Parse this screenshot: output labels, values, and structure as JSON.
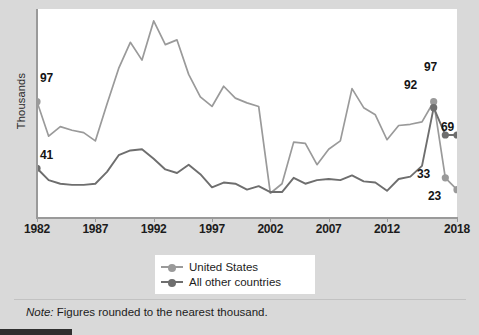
{
  "figure": {
    "ylabel": "Thousands",
    "note_label": "Note:",
    "note_text": " Figures rounded to the nearest thousand.",
    "colors": {
      "series_us": "#9a9a9a",
      "series_other": "#6e6e6e",
      "axis": "#9a9a9a",
      "plot_background": "#ffffff",
      "page_background": "#d9d9d9",
      "text": "#1c1c1c"
    }
  },
  "legend": {
    "position": "below-axis-center",
    "items": [
      {
        "label": "United States",
        "color": "#9a9a9a",
        "marker": "circle"
      },
      {
        "label": "All other countries",
        "color": "#6e6e6e",
        "marker": "circle"
      }
    ]
  },
  "annotations": [
    {
      "id": "us-start",
      "text": "97",
      "x": 40,
      "y": 71,
      "series": "United States",
      "year": 1982,
      "value": 97
    },
    {
      "id": "oth-start",
      "text": "41",
      "x": 40,
      "y": 148,
      "series": "All other countries",
      "year": 1982,
      "value": 41
    },
    {
      "id": "us-peak",
      "text": "97",
      "x": 424,
      "y": 60,
      "series": "United States",
      "year": 2016,
      "value": 97
    },
    {
      "id": "oth-peak",
      "text": "92",
      "x": 404,
      "y": 78,
      "series": "All other countries",
      "year": 2016,
      "value": 92
    },
    {
      "id": "oth-end",
      "text": "69",
      "x": 441,
      "y": 120,
      "series": "All other countries",
      "year": 2018,
      "value": 69
    },
    {
      "id": "us-2017",
      "text": "33",
      "x": 417,
      "y": 167,
      "series": "United States",
      "year": 2017,
      "value": 33
    },
    {
      "id": "us-end",
      "text": "23",
      "x": 428,
      "y": 189,
      "series": "United States",
      "year": 2018,
      "value": 23
    }
  ],
  "chart_data": {
    "type": "line",
    "title": "",
    "xlabel": "",
    "ylabel": "Thousands",
    "grid": false,
    "legend_position": "bottom-center",
    "note": "Note: Figures rounded to the nearest thousand.",
    "xlim": [
      1982,
      2018
    ],
    "ylim": [
      0,
      175
    ],
    "xticks": [
      1982,
      1987,
      1992,
      1997,
      2002,
      2007,
      2012,
      2018
    ],
    "xticklabels": [
      "1982",
      "1987",
      "1992",
      "1997",
      "2002",
      "2007",
      "2012",
      "2018"
    ],
    "yticks": [],
    "yticklabels": [],
    "x": [
      1982,
      1983,
      1984,
      1985,
      1986,
      1987,
      1988,
      1989,
      1990,
      1991,
      1992,
      1993,
      1994,
      1995,
      1996,
      1997,
      1998,
      1999,
      2000,
      2001,
      2002,
      2003,
      2004,
      2005,
      2006,
      2007,
      2008,
      2009,
      2010,
      2011,
      2012,
      2013,
      2014,
      2015,
      2016,
      2017,
      2018
    ],
    "series": [
      {
        "name": "United States",
        "color": "#9a9a9a",
        "marker": "circle",
        "labelled_points": {
          "1982": 97,
          "2016": 97,
          "2017": 33,
          "2018": 23
        },
        "values": [
          97,
          68,
          76,
          73,
          71,
          64,
          95,
          125,
          147,
          132,
          165,
          145,
          149,
          120,
          101,
          93,
          110,
          100,
          96,
          93,
          20,
          28,
          63,
          62,
          44,
          57,
          64,
          108,
          92,
          86,
          65,
          77,
          78,
          80,
          97,
          33,
          23
        ]
      },
      {
        "name": "All other countries",
        "color": "#6e6e6e",
        "marker": "circle",
        "labelled_points": {
          "1982": 41,
          "2016": 92,
          "2017": 69,
          "2018": 69
        },
        "values": [
          41,
          31,
          28,
          27,
          27,
          28,
          38,
          52,
          56,
          57,
          49,
          40,
          37,
          44,
          36,
          25,
          29,
          28,
          23,
          26,
          21,
          21,
          33,
          28,
          31,
          32,
          31,
          35,
          30,
          29,
          22,
          32,
          34,
          43,
          92,
          69,
          69
        ]
      }
    ]
  }
}
